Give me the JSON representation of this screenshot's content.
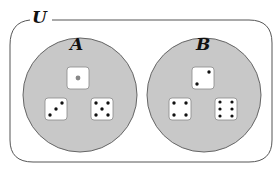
{
  "diagram": {
    "type": "venn",
    "universe": {
      "label": "U"
    },
    "sets": [
      {
        "label": "A",
        "fill": "#c8c8c8",
        "elements": [
          {
            "name": "die-1",
            "value": 1
          },
          {
            "name": "die-3",
            "value": 3
          },
          {
            "name": "die-5",
            "value": 5
          }
        ]
      },
      {
        "label": "B",
        "fill": "#c8c8c8",
        "elements": [
          {
            "name": "die-2",
            "value": 2
          },
          {
            "name": "die-4",
            "value": 4
          },
          {
            "name": "die-6",
            "value": 6
          }
        ]
      }
    ],
    "colors": {
      "frame": "#555555",
      "circle_fill": "#c8c8c8",
      "circle_stroke": "#666666",
      "die_face": "#ffffff",
      "pip": "#111111",
      "center_pip_one": "#888888"
    }
  }
}
